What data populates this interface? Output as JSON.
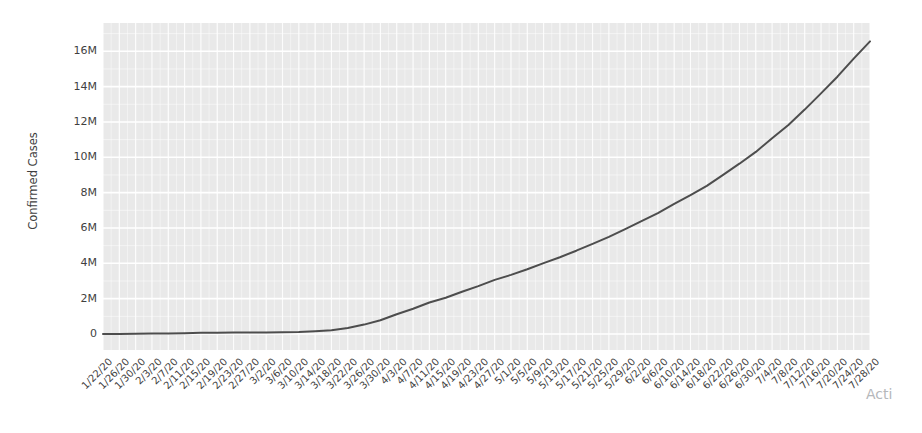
{
  "page": {
    "watermark_text": "Acti",
    "background_color": "#ffffff"
  },
  "chart_data": {
    "type": "line",
    "title": "",
    "xlabel": "",
    "ylabel": "Confirmed Cases",
    "x": [
      "1/22/20",
      "1/26/20",
      "1/30/20",
      "2/3/20",
      "2/7/20",
      "2/11/20",
      "2/15/20",
      "2/19/20",
      "2/23/20",
      "2/27/20",
      "3/2/20",
      "3/6/20",
      "3/10/20",
      "3/14/20",
      "3/18/20",
      "3/22/20",
      "3/26/20",
      "3/30/20",
      "4/3/20",
      "4/7/20",
      "4/11/20",
      "4/15/20",
      "4/19/20",
      "4/23/20",
      "4/27/20",
      "5/1/20",
      "5/5/20",
      "5/9/20",
      "5/13/20",
      "5/17/20",
      "5/21/20",
      "5/25/20",
      "5/29/20",
      "6/2/20",
      "6/6/20",
      "6/10/20",
      "6/14/20",
      "6/18/20",
      "6/22/20",
      "6/26/20",
      "6/30/20",
      "7/4/20",
      "7/8/20",
      "7/12/20",
      "7/16/20",
      "7/20/20",
      "7/24/20",
      "7/28/20"
    ],
    "series": [
      {
        "name": "Confirmed Cases",
        "values_millions": [
          0.001,
          0.002,
          0.01,
          0.02,
          0.035,
          0.045,
          0.069,
          0.076,
          0.079,
          0.083,
          0.09,
          0.102,
          0.119,
          0.156,
          0.215,
          0.337,
          0.53,
          0.782,
          1.119,
          1.426,
          1.78,
          2.056,
          2.394,
          2.709,
          3.063,
          3.344,
          3.663,
          4.014,
          4.347,
          4.714,
          5.102,
          5.495,
          5.935,
          6.383,
          6.835,
          7.36,
          7.855,
          8.385,
          9.007,
          9.636,
          10.303,
          11.075,
          11.831,
          12.699,
          13.617,
          14.563,
          15.582,
          16.558
        ]
      }
    ],
    "y_tick_labels": [
      "0",
      "2M",
      "4M",
      "6M",
      "8M",
      "10M",
      "12M",
      "14M",
      "16M"
    ],
    "y_tick_values_millions": [
      0,
      2,
      4,
      6,
      8,
      10,
      12,
      14,
      16
    ],
    "ylim_millions": [
      0,
      17.6
    ],
    "x_range": [
      "1/22/20",
      "7/28/20"
    ],
    "grid": "on",
    "legend": "none",
    "colors": {
      "line": "#4d4d4d",
      "plot_background": "#e9e9e9",
      "gridline": "#ffffff",
      "tick_label": "#3f3f3f",
      "watermark": "#b5b8bb"
    }
  }
}
